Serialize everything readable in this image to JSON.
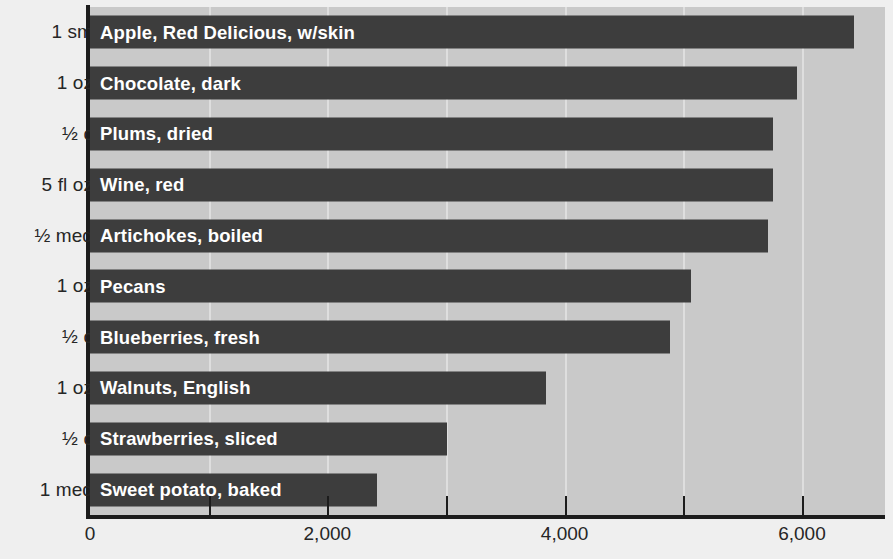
{
  "chart_data": {
    "type": "bar",
    "orientation": "horizontal",
    "title": "",
    "xlabel": "",
    "ylabel": "",
    "xlim": [
      0,
      6700
    ],
    "grid": true,
    "legend": null,
    "categories": [
      "Apple, Red Delicious, w/skin",
      "Chocolate, dark",
      "Plums, dried",
      "Wine, red",
      "Artichokes, boiled",
      "Pecans",
      "Blueberries, fresh",
      "Walnuts, English",
      "Strawberries, sliced",
      "Sweet potato, baked"
    ],
    "values": [
      6437,
      5958,
      5756,
      5756,
      5714,
      5067,
      4891,
      3840,
      3008,
      2420
    ],
    "servings": [
      "1 sm",
      "1 oz",
      "½ c",
      "5 fl oz",
      "½ med",
      "1 oz",
      "½ c",
      "1 oz",
      "½ c",
      "1 med"
    ],
    "xticks": [
      0,
      1000,
      2000,
      3000,
      4000,
      5000,
      6000,
      7000
    ],
    "xtick_labels": [
      "0",
      "",
      "2,000",
      "",
      "4,000",
      "",
      "6,000",
      ""
    ],
    "colors": {
      "bar": "#3d3d3d",
      "plot_background": "#c9c9c9",
      "page_background": "#efefef",
      "gridline": "#dedede",
      "axis": "#1c1c1c",
      "bar_label_text": "#ffffff",
      "axis_label_text": "#262626"
    }
  }
}
